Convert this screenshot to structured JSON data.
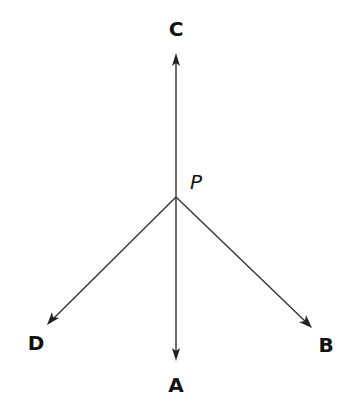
{
  "diagram": {
    "type": "rays-from-point",
    "origin": {
      "label": "P",
      "x": 176,
      "y": 197
    },
    "rays": [
      {
        "id": "C",
        "label": "C",
        "direction": "up",
        "tip": {
          "x": 176,
          "y": 53
        },
        "label_pos": {
          "x": 176,
          "y": 35
        }
      },
      {
        "id": "A",
        "label": "A",
        "direction": "down",
        "tip": {
          "x": 176,
          "y": 361
        },
        "label_pos": {
          "x": 176,
          "y": 392
        }
      },
      {
        "id": "D",
        "label": "D",
        "direction": "down-left",
        "tip": {
          "x": 47,
          "y": 325
        },
        "label_pos": {
          "x": 36,
          "y": 350
        }
      },
      {
        "id": "B",
        "label": "B",
        "direction": "down-right",
        "tip": {
          "x": 312,
          "y": 328
        },
        "label_pos": {
          "x": 326,
          "y": 352
        }
      }
    ],
    "colors": {
      "line": "#333333",
      "text": "#111111",
      "background": "#ffffff"
    }
  },
  "labels": {
    "point": "P",
    "c": "C",
    "a": "A",
    "d": "D",
    "b": "B"
  }
}
